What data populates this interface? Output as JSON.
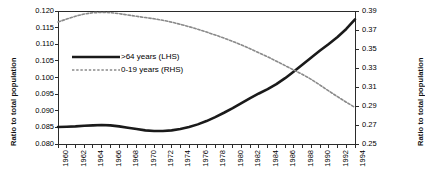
{
  "chart_data": {
    "type": "line",
    "title": "",
    "xlabel": "",
    "ylabel": "Ratio to total population",
    "ylabel_right": "Ratio to total population",
    "grid": false,
    "legend_position": "inside-upper-left",
    "x": [
      1960,
      1961,
      1962,
      1963,
      1964,
      1965,
      1966,
      1967,
      1968,
      1969,
      1970,
      1971,
      1972,
      1973,
      1974,
      1975,
      1976,
      1977,
      1978,
      1979,
      1980,
      1981,
      1982,
      1983,
      1984,
      1985,
      1986,
      1987,
      1988,
      1989,
      1990,
      1991,
      1992,
      1993,
      1994
    ],
    "xticklabels": [
      "1960",
      "1962",
      "1964",
      "1966",
      "1968",
      "1970",
      "1972",
      "1974",
      "1976",
      "1978",
      "1980",
      "1982",
      "1984",
      "1986",
      "1988",
      "1990",
      "1992",
      "1994"
    ],
    "ylim": [
      0.08,
      0.12
    ],
    "yticks": [
      0.08,
      0.085,
      0.09,
      0.095,
      0.1,
      0.105,
      0.11,
      0.115,
      0.12
    ],
    "yticklabels": [
      "0.080",
      "0.085",
      "0.090",
      "0.095",
      "0.100",
      "0.105",
      "0.110",
      "0.115",
      "0.120"
    ],
    "ylim_right": [
      0.25,
      0.39
    ],
    "yticks_right": [
      0.25,
      0.27,
      0.29,
      0.31,
      0.33,
      0.35,
      0.37,
      0.39
    ],
    "yticklabels_right": [
      "0.25",
      "0.27",
      "0.29",
      "0.31",
      "0.33",
      "0.35",
      "0.37",
      "0.39"
    ],
    "series": [
      {
        "name": ">64 years (LHS)",
        "axis": "left",
        "style": "solid",
        "color": "#1a1a1a",
        "width": 2.6,
        "values": [
          0.0851,
          0.0852,
          0.0853,
          0.0855,
          0.0856,
          0.0857,
          0.0856,
          0.0853,
          0.0849,
          0.0845,
          0.0841,
          0.0839,
          0.0839,
          0.0841,
          0.0845,
          0.0851,
          0.0859,
          0.0869,
          0.0881,
          0.0894,
          0.0908,
          0.0923,
          0.0938,
          0.0952,
          0.0965,
          0.098,
          0.0998,
          0.1018,
          0.1039,
          0.106,
          0.1081,
          0.1101,
          0.1122,
          0.1146,
          0.1175
        ]
      },
      {
        "name": "0-19 years (RHS)",
        "axis": "right",
        "style": "dashed",
        "color": "#8a8a8a",
        "width": 1.6,
        "values": [
          0.3785,
          0.3815,
          0.3845,
          0.3868,
          0.3882,
          0.3885,
          0.3883,
          0.3872,
          0.3858,
          0.3844,
          0.3831,
          0.3818,
          0.3802,
          0.3783,
          0.376,
          0.3735,
          0.3708,
          0.3678,
          0.3648,
          0.3615,
          0.358,
          0.3543,
          0.3503,
          0.346,
          0.3418,
          0.3372,
          0.3325,
          0.3278,
          0.3232,
          0.318,
          0.312,
          0.3058,
          0.2998,
          0.294,
          0.2885
        ]
      }
    ]
  },
  "legend": {
    "items": [
      {
        "label": ">64 years (LHS)",
        "style": "solid"
      },
      {
        "label": "0-19 years (RHS)",
        "style": "dashed"
      }
    ]
  }
}
